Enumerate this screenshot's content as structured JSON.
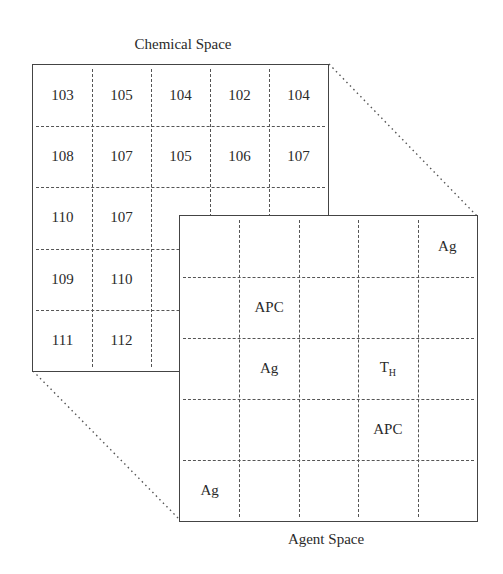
{
  "chemical_space": {
    "title": "Chemical Space",
    "rows": 5,
    "cols": 5,
    "cells": [
      [
        "103",
        "105",
        "104",
        "102",
        "104"
      ],
      [
        "108",
        "107",
        "105",
        "106",
        "107"
      ],
      [
        "110",
        "107",
        "",
        "",
        ""
      ],
      [
        "109",
        "110",
        "",
        "",
        ""
      ],
      [
        "111",
        "112",
        "",
        "",
        ""
      ]
    ]
  },
  "agent_space": {
    "title": "Agent Space",
    "rows": 5,
    "cols": 5,
    "cells": [
      [
        "",
        "",
        "",
        "",
        "Ag"
      ],
      [
        "",
        "APC",
        "",
        "",
        ""
      ],
      [
        "",
        "Ag",
        "",
        "T_H",
        ""
      ],
      [
        "",
        "",
        "",
        "APC",
        ""
      ],
      [
        "Ag",
        "",
        "",
        "",
        ""
      ]
    ]
  },
  "labels": {
    "th_main": "T",
    "th_sub": "H"
  }
}
